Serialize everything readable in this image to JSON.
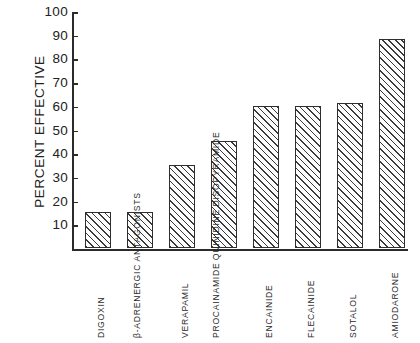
{
  "chart_data": {
    "type": "bar",
    "title": "",
    "xlabel": "",
    "ylabel": "PERCENT EFFECTIVE",
    "ylim": [
      0,
      100
    ],
    "ytick_values": [
      100,
      90,
      80,
      70,
      60,
      50,
      40,
      30,
      20,
      10
    ],
    "ytick_labels": [
      "100",
      "90",
      "80",
      "70",
      "60",
      "50",
      "40",
      "30",
      "20",
      "10"
    ],
    "grid": false,
    "legend": null,
    "categories": [
      "DIGOXIN",
      "β-ADRENERGIC ANTAGONISTS",
      "VERAPAMIL",
      "PROCAINAMIDE QUINIDINE DISOPYRAMIDE",
      "ENCAINIDE",
      "FLECAINIDE",
      "SOTALOL",
      "AMIODARONE"
    ],
    "category_lines": [
      [
        "DIGOXIN"
      ],
      [
        "β-ADRENERGIC",
        "ANTAGONISTS"
      ],
      [
        "VERAPAMIL"
      ],
      [
        "PROCAINAMIDE",
        "QUINIDINE",
        "DISOPYRAMIDE"
      ],
      [
        "ENCAINIDE"
      ],
      [
        "FLECAINIDE"
      ],
      [
        "SOTALOL"
      ],
      [
        "AMIODARONE"
      ]
    ],
    "values": [
      15,
      15,
      35,
      45,
      60,
      60,
      61,
      88
    ],
    "bar_fill": "diagonal-hatch",
    "bar_edge_color": "#2e2e2e",
    "axis_color": "#2b2b2b",
    "background_color": "#ffffff"
  }
}
